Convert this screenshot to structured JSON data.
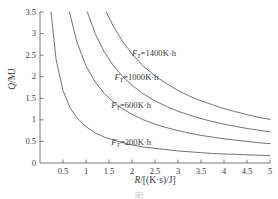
{
  "chart_data": {
    "type": "line",
    "title": "",
    "xlabel": "R/[(K·s)/J]",
    "ylabel": "Q/MJ",
    "xlim": [
      0,
      5
    ],
    "ylim": [
      0,
      3.5
    ],
    "grid": false,
    "legend_position": "inline-labels",
    "xticks": [
      "0.5",
      "1",
      "1.5",
      "2",
      "2.5",
      "3",
      "3.5",
      "4",
      "4.5",
      "5"
    ],
    "xtick_values": [
      0.5,
      1,
      1.5,
      2,
      2.5,
      3,
      3.5,
      4,
      4.5,
      5
    ],
    "yticks": [
      "0",
      "0.5",
      "1",
      "1.5",
      "2",
      "2.5",
      "3",
      "3.5"
    ],
    "ytick_values": [
      0,
      0.5,
      1,
      1.5,
      2,
      2.5,
      3,
      3.5
    ],
    "relation": "Q = k / R",
    "series": [
      {
        "name": "F_T=1400K·h",
        "symbol": "F",
        "subscript": "T",
        "value": 1400,
        "unit": "K·h",
        "k": 5.05,
        "x": [
          1.44,
          1.6,
          1.8,
          2.0,
          2.25,
          2.5,
          2.75,
          3.0,
          3.25,
          3.5,
          3.75,
          4.0,
          4.25,
          4.5,
          4.75,
          5.0
        ],
        "y": [
          3.5,
          3.16,
          2.81,
          2.53,
          2.24,
          2.02,
          1.84,
          1.68,
          1.55,
          1.44,
          1.35,
          1.26,
          1.19,
          1.12,
          1.06,
          1.01
        ]
      },
      {
        "name": "F_T=1000K·h",
        "symbol": "F",
        "subscript": "T",
        "value": 1000,
        "unit": "K·h",
        "k": 3.6,
        "x": [
          1.03,
          1.2,
          1.4,
          1.6,
          1.8,
          2.0,
          2.25,
          2.5,
          2.75,
          3.0,
          3.25,
          3.5,
          3.75,
          4.0,
          4.25,
          4.5,
          4.75,
          5.0
        ],
        "y": [
          3.5,
          3.0,
          2.57,
          2.25,
          2.0,
          1.8,
          1.6,
          1.44,
          1.31,
          1.2,
          1.11,
          1.03,
          0.96,
          0.9,
          0.85,
          0.8,
          0.76,
          0.72
        ]
      },
      {
        "name": "F_T=600K·h",
        "symbol": "F",
        "subscript": "T",
        "value": 600,
        "unit": "K·h",
        "k": 2.25,
        "x": [
          0.64,
          0.8,
          1.0,
          1.2,
          1.4,
          1.6,
          1.8,
          2.0,
          2.25,
          2.5,
          2.75,
          3.0,
          3.25,
          3.5,
          3.75,
          4.0,
          4.25,
          4.5,
          4.75,
          5.0
        ],
        "y": [
          3.5,
          2.81,
          2.25,
          1.88,
          1.61,
          1.41,
          1.25,
          1.13,
          1.0,
          0.9,
          0.82,
          0.75,
          0.69,
          0.64,
          0.6,
          0.56,
          0.53,
          0.5,
          0.47,
          0.45
        ]
      },
      {
        "name": "F_T=200K·h",
        "symbol": "F",
        "subscript": "T",
        "value": 200,
        "unit": "K·h",
        "k": 0.84,
        "x": [
          0.24,
          0.35,
          0.5,
          0.65,
          0.8,
          1.0,
          1.2,
          1.4,
          1.6,
          1.8,
          2.0,
          2.25,
          2.5,
          2.75,
          3.0,
          3.25,
          3.5,
          3.75,
          4.0,
          4.25,
          4.5,
          4.75,
          5.0
        ],
        "y": [
          3.5,
          2.4,
          1.68,
          1.29,
          1.05,
          0.84,
          0.7,
          0.6,
          0.53,
          0.47,
          0.42,
          0.37,
          0.34,
          0.31,
          0.28,
          0.26,
          0.24,
          0.22,
          0.21,
          0.2,
          0.19,
          0.18,
          0.17
        ]
      }
    ],
    "annotations": [
      {
        "text": "F_T=1400K·h",
        "x": 2.0,
        "y": 2.52
      },
      {
        "text": "F_T=1000K·h",
        "x": 1.62,
        "y": 1.98
      },
      {
        "text": "F_T=600K·h",
        "x": 1.55,
        "y": 1.33
      },
      {
        "text": "F_T=200K·h",
        "x": 1.55,
        "y": 0.47
      }
    ]
  },
  "axes": {
    "y_label_numerator": "Q",
    "y_label_sep": "/",
    "y_label_unit": "MJ",
    "x_label_numerator": "R",
    "x_label_rest": "/[(K·s)/J]"
  },
  "colors": {
    "curve": "#6b6b6b",
    "axis": "#6b6b6b",
    "text": "#3a3a3a",
    "background": "#ffffff",
    "caption": "#c9c9c9"
  },
  "caption": {
    "text": "图"
  }
}
